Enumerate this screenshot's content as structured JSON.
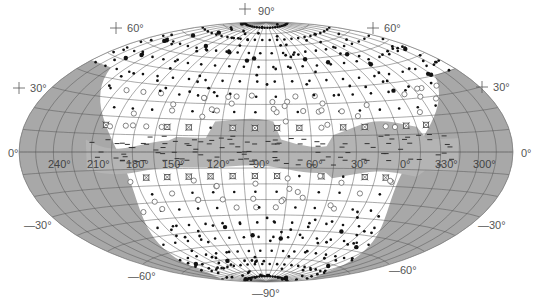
{
  "projection": {
    "type": "Hammer-Aitoff all-sky",
    "center_x": 266,
    "center_y": 152,
    "semi_major": 247,
    "semi_minor": 130
  },
  "colors": {
    "background": "#ffffff",
    "sky_interior": "#ffffff",
    "shaded_region": "#a8a8a8",
    "plane_band": "#b4b4b4",
    "grid_line": "#555555",
    "outline": "#888888",
    "dot": "#111111",
    "open_circle": "#666666",
    "cross_symbol": "#444444"
  },
  "latitude_labels": [
    {
      "text": "+90°",
      "x": 252,
      "y": 5,
      "name": "lat-label-plus-90"
    },
    {
      "text": "+60°",
      "x": 121,
      "y": 22,
      "name": "lat-label-plus-60-left"
    },
    {
      "text": "+60°",
      "x": 378,
      "y": 22,
      "name": "lat-label-plus-60-right"
    },
    {
      "text": "+30°",
      "x": 24,
      "y": 82,
      "name": "lat-label-plus-30-left"
    },
    {
      "text": "+30°",
      "x": 487,
      "y": 81,
      "name": "lat-label-plus-30-right"
    },
    {
      "text": "0°",
      "x": 8,
      "y": 147,
      "name": "lat-label-0-left"
    },
    {
      "text": "0°",
      "x": 521,
      "y": 147,
      "name": "lat-label-0-right"
    },
    {
      "text": "—30°",
      "x": 24,
      "y": 219,
      "name": "lat-label-minus-30-left"
    },
    {
      "text": "—30°",
      "x": 478,
      "y": 219,
      "name": "lat-label-minus-30-right"
    },
    {
      "text": "—60°",
      "x": 128,
      "y": 270,
      "name": "lat-label-minus-60-left"
    },
    {
      "text": "—60°",
      "x": 389,
      "y": 264,
      "name": "lat-label-minus-60-right"
    },
    {
      "text": "—90°",
      "x": 252,
      "y": 287,
      "name": "lat-label-minus-90"
    }
  ],
  "longitude_labels": [
    {
      "text": "240°",
      "x": 48,
      "y": 158
    },
    {
      "text": "210°",
      "x": 87,
      "y": 158
    },
    {
      "text": "180°",
      "x": 126,
      "y": 158
    },
    {
      "text": "150°",
      "x": 162,
      "y": 158
    },
    {
      "text": "120°",
      "x": 207,
      "y": 158
    },
    {
      "text": "90°",
      "x": 253,
      "y": 158
    },
    {
      "text": "60°",
      "x": 306,
      "y": 158
    },
    {
      "text": "30°",
      "x": 351,
      "y": 158
    },
    {
      "text": "0°",
      "x": 400,
      "y": 158
    },
    {
      "text": "330°",
      "x": 435,
      "y": 158
    },
    {
      "text": "300°",
      "x": 473,
      "y": 158
    }
  ],
  "grid": {
    "meridian_step_deg": 15,
    "parallel_step_deg": 10
  },
  "legend_symbols": {
    "filled_dot": "source (filled dot)",
    "open_circle": "source (open circle)",
    "cross_square": "source (boxed cross)"
  }
}
